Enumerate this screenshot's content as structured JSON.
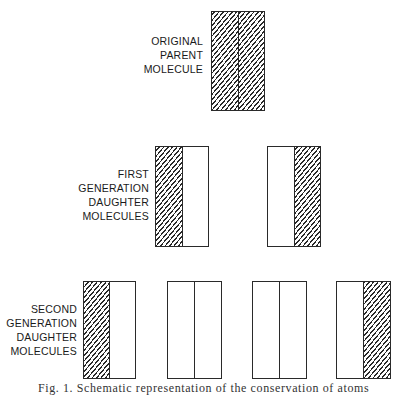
{
  "figure": {
    "rows": [
      {
        "label": [
          "ORIGINAL",
          "PARENT",
          "MOLECULE"
        ],
        "molecules": [
          {
            "strands": [
              "hatched",
              "hatched"
            ]
          }
        ]
      },
      {
        "label": [
          "FIRST",
          "GENERATION",
          "DAUGHTER",
          "MOLECULES"
        ],
        "molecules": [
          {
            "strands": [
              "hatched",
              "blank"
            ]
          },
          {
            "strands": [
              "blank",
              "hatched"
            ]
          }
        ]
      },
      {
        "label": [
          "SECOND",
          "GENERATION",
          "DAUGHTER",
          "MOLECULES"
        ],
        "molecules": [
          {
            "strands": [
              "hatched",
              "blank"
            ]
          },
          {
            "strands": [
              "blank",
              "blank"
            ]
          },
          {
            "strands": [
              "blank",
              "blank"
            ]
          },
          {
            "strands": [
              "blank",
              "hatched"
            ]
          }
        ]
      }
    ],
    "legend": {
      "hatched": "parental (old) strand",
      "blank": "newly synthesized strand"
    },
    "caption": "Fig. 1. Schematic representation of the conservation of atoms"
  },
  "colors": {
    "line": "#2a2a2a",
    "background": "#ffffff"
  }
}
